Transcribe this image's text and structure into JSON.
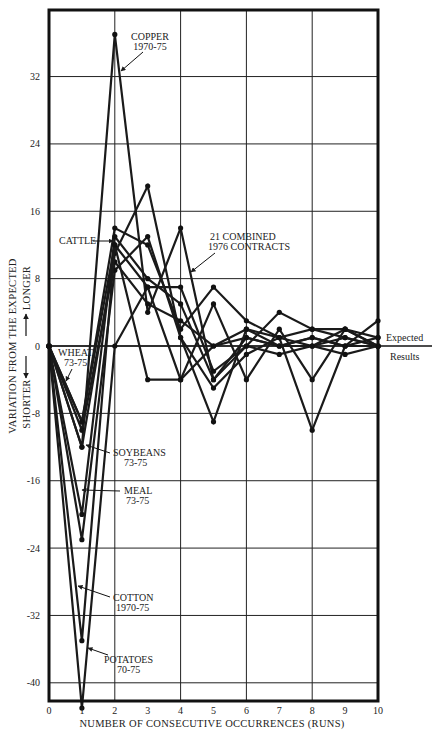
{
  "chart_data": {
    "type": "line",
    "title": "",
    "xlabel": "NUMBER OF CONSECUTIVE OCCURRENCES (RUNS)",
    "ylabel": "VARIATION FROM THE EXPECTED",
    "ylabel_longer": "LONGER",
    "ylabel_shorter": "SHORTER",
    "xlim": [
      0,
      10
    ],
    "ylim": [
      -42,
      39
    ],
    "x_ticks": [
      "0",
      "1",
      "2",
      "3",
      "4",
      "5",
      "6",
      "7",
      "8",
      "9",
      "10"
    ],
    "y_ticks": [
      "32",
      "24",
      "16",
      "8",
      "0",
      "-8",
      "-16",
      "-24",
      "-32",
      "-40"
    ],
    "y_tick_values": [
      32,
      24,
      16,
      8,
      0,
      -8,
      -16,
      -24,
      -32,
      -40
    ],
    "x_grid": [
      2,
      4,
      6,
      8
    ],
    "grid": true,
    "reference_line": {
      "y": 0,
      "label_above": "Expected",
      "label_below": "Results"
    },
    "x": [
      0,
      1,
      2,
      3,
      4,
      5,
      6,
      7,
      8,
      9,
      10
    ],
    "series": [
      {
        "name": "COPPER 1970-75",
        "values": [
          0,
          -12,
          37,
          4,
          14,
          -4,
          1,
          0,
          1,
          0,
          0
        ]
      },
      {
        "name": "CATTLE",
        "values": [
          0,
          -9,
          14,
          12,
          2,
          7,
          3,
          1,
          2,
          1,
          0
        ]
      },
      {
        "name": "21 COMBINED 1976 CONTRACTS",
        "values": [
          0,
          -10,
          10,
          5,
          3,
          0,
          1,
          0,
          1,
          0,
          1
        ]
      },
      {
        "name": "WHEAT 73-75",
        "values": [
          0,
          -9,
          12,
          7,
          -4,
          0,
          2,
          0,
          0,
          1,
          0
        ]
      },
      {
        "name": "SOYBEANS 73-75",
        "values": [
          0,
          -12,
          11,
          19,
          1,
          -5,
          -1,
          1,
          0,
          2,
          0
        ]
      },
      {
        "name": "MEAL 73-75",
        "values": [
          0,
          -20,
          13,
          8,
          5,
          -4,
          0,
          4,
          2,
          2,
          0
        ]
      },
      {
        "name": "COTTON 1970-75",
        "values": [
          0,
          -23,
          9,
          13,
          1,
          -9,
          2,
          1,
          -10,
          0,
          3
        ]
      },
      {
        "name": "POTATOES 70-75",
        "values": [
          0,
          -35,
          12,
          -4,
          -4,
          5,
          -4,
          2,
          -4,
          2,
          1
        ]
      },
      {
        "name": "POTATOES-extreme",
        "values": [
          0,
          -43,
          0,
          7,
          7,
          -3,
          0,
          -1,
          0,
          -1,
          0
        ]
      }
    ],
    "annotations": [
      {
        "text": [
          "COPPER",
          "1970-75"
        ],
        "target": "COPPER 1970-75"
      },
      {
        "text": [
          "CATTLE"
        ],
        "target": "CATTLE"
      },
      {
        "text": [
          "21 COMBINED",
          "1976 CONTRACTS"
        ],
        "target": "21 COMBINED 1976 CONTRACTS"
      },
      {
        "text": [
          "WHEAT",
          "73-75"
        ],
        "target": "WHEAT 73-75"
      },
      {
        "text": [
          "SOYBEANS",
          "73-75"
        ],
        "target": "SOYBEANS 73-75"
      },
      {
        "text": [
          "MEAL",
          "73-75"
        ],
        "target": "MEAL 73-75"
      },
      {
        "text": [
          "COTTON",
          "1970-75"
        ],
        "target": "COTTON 1970-75"
      },
      {
        "text": [
          "POTATOES",
          "70-75"
        ],
        "target": "POTATOES 70-75"
      }
    ],
    "legend": "none (inline annotations with arrows)"
  },
  "labels": {
    "copper_1": "COPPER",
    "copper_2": "1970-75",
    "cattle": "CATTLE",
    "combined_1": "21 COMBINED",
    "combined_2": "1976 CONTRACTS",
    "wheat_1": "WHEAT",
    "wheat_2": "73-75",
    "soybeans_1": "SOYBEANS",
    "soybeans_2": "73-75",
    "meal_1": "MEAL",
    "meal_2": "73-75",
    "cotton_1": "COTTON",
    "cotton_2": "1970-75",
    "potatoes_1": "POTATOES",
    "potatoes_2": "70-75",
    "expected": "Expected",
    "results": "Results"
  }
}
